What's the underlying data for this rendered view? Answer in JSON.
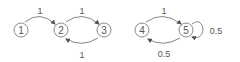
{
  "graphs": [
    {
      "nodes": [
        {
          "id": "1",
          "label": "1",
          "x": 21,
          "y": 30
        },
        {
          "id": "2",
          "label": "2",
          "x": 61,
          "y": 30
        },
        {
          "id": "3",
          "label": "3",
          "x": 104,
          "y": 30
        }
      ],
      "edges": [
        {
          "from": "1",
          "to": "2",
          "weight": "1"
        },
        {
          "from": "2",
          "to": "3",
          "weight": "1"
        },
        {
          "from": "3",
          "to": "2",
          "weight": "1"
        }
      ]
    },
    {
      "nodes": [
        {
          "id": "4",
          "label": "4",
          "x": 142,
          "y": 30
        },
        {
          "id": "5",
          "label": "5",
          "x": 186,
          "y": 30
        }
      ],
      "edges": [
        {
          "from": "4",
          "to": "5",
          "weight": "1"
        },
        {
          "from": "5",
          "to": "5",
          "weight": "0.5"
        },
        {
          "from": "5",
          "to": "4",
          "weight": "0.5"
        }
      ]
    }
  ],
  "colors": {
    "stroke": "#8a8a8a",
    "text": "#555555"
  }
}
